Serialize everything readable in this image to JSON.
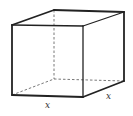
{
  "figure": {
    "type": "rectangular-prism",
    "labels": {
      "front_width": "x",
      "depth": "x"
    },
    "colors": {
      "stroke": "#222222",
      "hidden_stroke": "#555555",
      "background": "#ffffff"
    }
  }
}
